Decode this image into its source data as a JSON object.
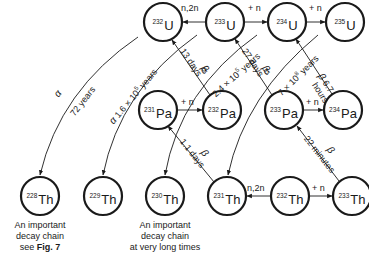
{
  "diagram": {
    "type": "nuclide reaction and decay network",
    "nodes": [
      {
        "id": "U232",
        "mass": "232",
        "symbol": "U",
        "x": 163,
        "y": 22
      },
      {
        "id": "U233",
        "mass": "233",
        "symbol": "U",
        "x": 225,
        "y": 22
      },
      {
        "id": "U234",
        "mass": "234",
        "symbol": "U",
        "x": 287,
        "y": 22
      },
      {
        "id": "U235",
        "mass": "235",
        "symbol": "U",
        "x": 345,
        "y": 22
      },
      {
        "id": "Pa231",
        "mass": "231",
        "symbol": "Pa",
        "x": 158,
        "y": 110
      },
      {
        "id": "Pa232",
        "mass": "232",
        "symbol": "Pa",
        "x": 222,
        "y": 110
      },
      {
        "id": "Pa233",
        "mass": "233",
        "symbol": "Pa",
        "x": 284,
        "y": 110
      },
      {
        "id": "Pa234",
        "mass": "234",
        "symbol": "Pa",
        "x": 343,
        "y": 110
      },
      {
        "id": "Th228",
        "mass": "228",
        "symbol": "Th",
        "x": 40,
        "y": 196
      },
      {
        "id": "Th229",
        "mass": "229",
        "symbol": "Th",
        "x": 103,
        "y": 196
      },
      {
        "id": "Th230",
        "mass": "230",
        "symbol": "Th",
        "x": 165,
        "y": 196
      },
      {
        "id": "Th231",
        "mass": "231",
        "symbol": "Th",
        "x": 227,
        "y": 196
      },
      {
        "id": "Th232",
        "mass": "232",
        "symbol": "Th",
        "x": 290,
        "y": 196
      },
      {
        "id": "Th233",
        "mass": "233",
        "symbol": "Th",
        "x": 352,
        "y": 196
      }
    ],
    "edges": [
      {
        "from": "U233",
        "to": "U232",
        "label": "n,2n"
      },
      {
        "from": "U233",
        "to": "U234",
        "label": "+ n"
      },
      {
        "from": "U234",
        "to": "U235",
        "label": "+ n"
      },
      {
        "from": "Pa231",
        "to": "Pa232",
        "label": "+ n"
      },
      {
        "from": "Pa233",
        "to": "Pa234",
        "label": "+ n"
      },
      {
        "from": "Th232",
        "to": "Th231",
        "label": "n,2n"
      },
      {
        "from": "Th232",
        "to": "Th233",
        "label": "+ n"
      },
      {
        "from": "Pa232",
        "to": "U232",
        "label": "β 13 days"
      },
      {
        "from": "Pa233",
        "to": "U233",
        "label": "β 27 days"
      },
      {
        "from": "Pa234",
        "to": "U234",
        "label": "β 6.7 hours"
      },
      {
        "from": "Th231",
        "to": "Pa231",
        "label": "β 1.1 days"
      },
      {
        "from": "Th233",
        "to": "Pa233",
        "label": "β 22 minutes"
      },
      {
        "from": "U232",
        "to": "Th228",
        "label": "α 72 years"
      },
      {
        "from": "U233",
        "to": "Th229",
        "label": "α 1.6 × 10⁵ years"
      },
      {
        "from": "U234",
        "to": "Th230",
        "label": "α 2.4 × 10⁵ years"
      },
      {
        "from": "U235",
        "to": "Th231",
        "label": "α 7 × 10⁸ years"
      }
    ]
  },
  "labels": {
    "n2n_top": "n,2n",
    "plus_n_u233": "+ n",
    "plus_n_u234": "+ n",
    "plus_n_pa231": "+ n",
    "plus_n_pa233": "+ n",
    "n2n_bottom": "n,2n",
    "plus_n_th232": "+ n",
    "alpha": "α",
    "beta": "β",
    "a72": "72 years",
    "a16": "1.6 × 105 years",
    "a24": "2.4 × 105 years",
    "a7": "7 × 108 years",
    "b13": "13 days",
    "b27": "27 days",
    "b67": "6.7",
    "b67h": "hours",
    "b11": "1.1 days",
    "b22": "22 minutes"
  },
  "captions": {
    "left": {
      "line1": "An important",
      "line2": "decay chain",
      "line3_prefix": "see ",
      "line3_bold": "Fig. 7"
    },
    "middle": {
      "line1": "An important",
      "line2": "decay chain",
      "line3": "at very long times"
    }
  }
}
